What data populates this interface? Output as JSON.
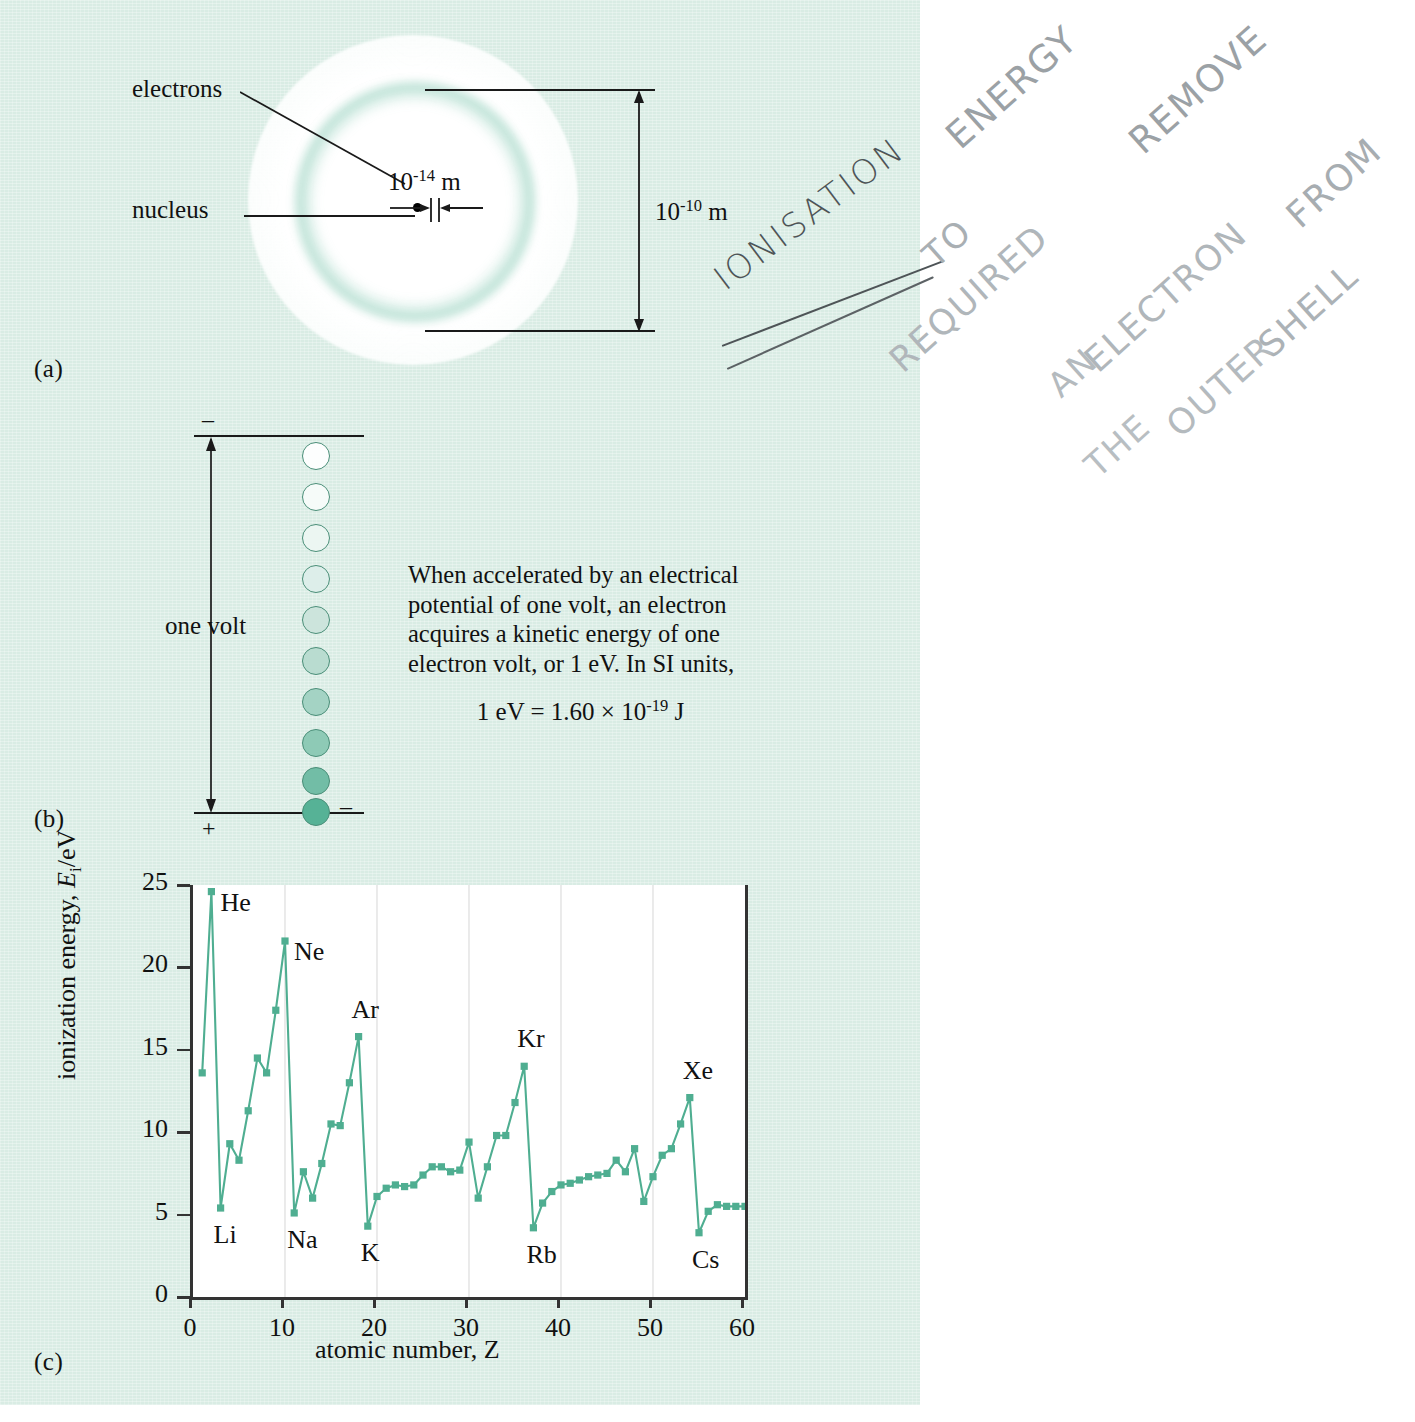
{
  "figure": {
    "panel_labels": {
      "a": "(a)",
      "b": "(b)",
      "c": "(c)"
    },
    "background_color": "#d9ece4",
    "accent_color": "#4fae91"
  },
  "atom_diagram": {
    "electrons_label": "electrons",
    "nucleus_label": "nucleus",
    "nucleus_size_base": "10",
    "nucleus_size_exp": "-14",
    "nucleus_size_unit": "m",
    "atom_size_base": "10",
    "atom_size_exp": "-10",
    "atom_size_unit": "m"
  },
  "volt_diagram": {
    "minus_top": "–",
    "plus_bottom": "+",
    "electron_minus": "–",
    "one_volt_label": "one volt",
    "electron_count": 10,
    "paragraph": "When accelerated by an electrical potential of one volt, an electron acquires a kinetic energy of one electron volt, or 1 eV. In SI units,",
    "equation_lhs": "1 eV = 1.60 × 10",
    "equation_exp": "-19",
    "equation_unit": "J"
  },
  "handwriting": {
    "heading": "IONISATION",
    "line1": "ENERGY",
    "line2": "REQUIRED",
    "line3": "TO",
    "line4": "REMOVE",
    "line5": "AN",
    "line6": "ELECTRON",
    "line7": "FROM",
    "line8": "THE",
    "line9": "OUTER",
    "line10": "SHELL"
  },
  "chart_data": {
    "type": "line",
    "title": "",
    "xlabel": "atomic number, Z",
    "ylabel": "ionization energy, Eᵢ/eV",
    "xlim": [
      0,
      60
    ],
    "ylim": [
      0,
      25
    ],
    "xticks": [
      0,
      10,
      20,
      30,
      40,
      50,
      60
    ],
    "yticks": [
      0,
      5,
      10,
      15,
      20,
      25
    ],
    "grid": "vertical-light",
    "legend": "none",
    "marker": "square",
    "line_color": "#4fae91",
    "x": [
      1,
      2,
      3,
      4,
      5,
      6,
      7,
      8,
      9,
      10,
      11,
      12,
      13,
      14,
      15,
      16,
      17,
      18,
      19,
      20,
      21,
      22,
      23,
      24,
      25,
      26,
      27,
      28,
      29,
      30,
      31,
      32,
      33,
      34,
      35,
      36,
      37,
      38,
      39,
      40,
      41,
      42,
      43,
      44,
      45,
      46,
      47,
      48,
      49,
      50,
      51,
      52,
      53,
      54,
      55,
      56,
      57,
      58,
      59,
      60
    ],
    "y": [
      13.6,
      24.6,
      5.4,
      9.3,
      8.3,
      11.3,
      14.5,
      13.6,
      17.4,
      21.6,
      5.1,
      7.6,
      6.0,
      8.1,
      10.5,
      10.4,
      13.0,
      15.8,
      4.3,
      6.1,
      6.6,
      6.8,
      6.7,
      6.8,
      7.4,
      7.9,
      7.9,
      7.6,
      7.7,
      9.4,
      6.0,
      7.9,
      9.8,
      9.8,
      11.8,
      14.0,
      4.2,
      5.7,
      6.4,
      6.8,
      6.9,
      7.1,
      7.3,
      7.4,
      7.5,
      8.3,
      7.6,
      9.0,
      5.8,
      7.3,
      8.6,
      9.0,
      10.5,
      12.1,
      3.9,
      5.2,
      5.6,
      5.5,
      5.5,
      5.5
    ],
    "annotations": [
      {
        "label": "He",
        "z": 2,
        "value": 24.6,
        "position": "right"
      },
      {
        "label": "Li",
        "z": 3,
        "value": 5.4,
        "position": "below"
      },
      {
        "label": "Ne",
        "z": 10,
        "value": 21.6,
        "position": "right"
      },
      {
        "label": "Na",
        "z": 11,
        "value": 5.1,
        "position": "below"
      },
      {
        "label": "Ar",
        "z": 18,
        "value": 15.8,
        "position": "above"
      },
      {
        "label": "K",
        "z": 19,
        "value": 4.3,
        "position": "below"
      },
      {
        "label": "Kr",
        "z": 36,
        "value": 14.0,
        "position": "above"
      },
      {
        "label": "Rb",
        "z": 37,
        "value": 4.2,
        "position": "below"
      },
      {
        "label": "Xe",
        "z": 54,
        "value": 12.1,
        "position": "above"
      },
      {
        "label": "Cs",
        "z": 55,
        "value": 3.9,
        "position": "below"
      }
    ]
  }
}
